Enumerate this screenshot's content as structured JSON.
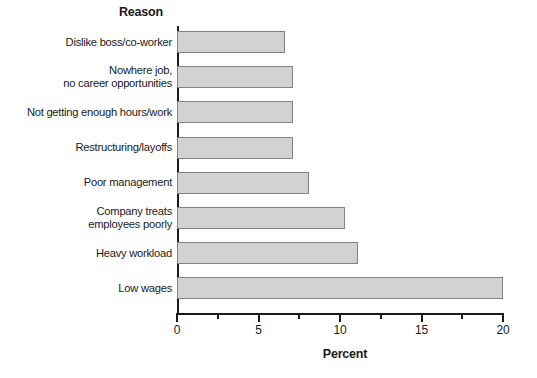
{
  "chart_data": {
    "type": "bar",
    "orientation": "horizontal",
    "title": "Reason",
    "xlabel": "Percent",
    "ylabel": "Reason",
    "xlim": [
      0,
      20
    ],
    "grid": false,
    "legend": null,
    "xticks": [
      0,
      5,
      10,
      15,
      20
    ],
    "xtick_labels": [
      "0",
      "5",
      "10",
      "15",
      "20"
    ],
    "xticks_minor": [
      2.5,
      7.5,
      12.5,
      17.5
    ],
    "categories": [
      "Dislike boss/co-worker",
      "Nowhere job,\nno career opportunities",
      "Not getting enough hours/work",
      "Restructuring/layoffs",
      "Poor management",
      "Company treats\nemployees poorly",
      "Heavy workload",
      "Low wages"
    ],
    "values": [
      6.6,
      7.1,
      7.1,
      7.1,
      8.1,
      10.3,
      11.1,
      20.0
    ],
    "bar_color": "#d2d2d2",
    "bar_border_color": "#828282",
    "axis_color": "#1a1a1a"
  }
}
